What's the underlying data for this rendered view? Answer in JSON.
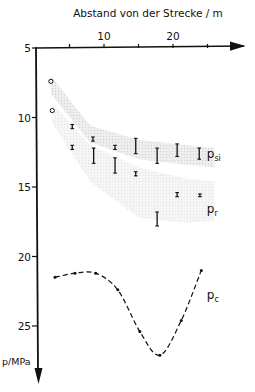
{
  "chart_data": {
    "type": "scatter",
    "title": "",
    "xlabel": "Abstand von der Strecke / m",
    "ylabel": "p/MPa",
    "xlim": [
      0,
      28
    ],
    "ylim": [
      5,
      28
    ],
    "y_inverted": true,
    "x_axis_position": "top",
    "x_ticks": [
      5,
      10,
      15,
      20,
      25
    ],
    "x_tick_labels": [
      "",
      "10",
      "",
      "20",
      ""
    ],
    "y_ticks": [
      5,
      10,
      15,
      20,
      25
    ],
    "y_tick_labels": [
      "5",
      "10",
      "15",
      "20",
      "25"
    ],
    "grid": false,
    "series": [
      {
        "name": "p_si",
        "label_main": "p",
        "label_sub": "si",
        "marker": "errorbar",
        "points": [
          {
            "x": 2.3,
            "y": 7.4,
            "marker": "circle"
          },
          {
            "x": 5.4,
            "y": 10.6,
            "ylow": 10.5,
            "yhigh": 10.8
          },
          {
            "x": 8.4,
            "y": 11.5,
            "ylow": 11.4,
            "yhigh": 11.7
          },
          {
            "x": 11.6,
            "y": 12.1,
            "ylow": 12.0,
            "yhigh": 12.3
          },
          {
            "x": 14.6,
            "y": 12.1,
            "ylow": 11.5,
            "yhigh": 12.6
          },
          {
            "x": 17.7,
            "y": 12.8,
            "ylow": 12.2,
            "yhigh": 13.3
          },
          {
            "x": 20.6,
            "y": 12.4,
            "ylow": 11.9,
            "yhigh": 12.8
          },
          {
            "x": 23.8,
            "y": 12.6,
            "ylow": 12.2,
            "yhigh": 13.0
          }
        ],
        "band": {
          "upper": [
            [
              2.3,
              7.0
            ],
            [
              8,
              10.6
            ],
            [
              15,
              11.6
            ],
            [
              22,
              12.0
            ],
            [
              26,
              12.2
            ]
          ],
          "lower": [
            [
              2.3,
              8.3
            ],
            [
              8,
              11.8
            ],
            [
              15,
              13.0
            ],
            [
              22,
              13.4
            ],
            [
              26,
              13.6
            ]
          ]
        }
      },
      {
        "name": "p_r",
        "label_main": "p",
        "label_sub": "r",
        "marker": "errorbar",
        "points": [
          {
            "x": 2.5,
            "y": 9.5,
            "marker": "circle"
          },
          {
            "x": 5.4,
            "y": 12.1,
            "ylow": 12.0,
            "yhigh": 12.3
          },
          {
            "x": 8.5,
            "y": 12.8,
            "ylow": 12.2,
            "yhigh": 13.3
          },
          {
            "x": 11.6,
            "y": 13.4,
            "ylow": 12.9,
            "yhigh": 14.0
          },
          {
            "x": 14.6,
            "y": 14.0,
            "ylow": 13.9,
            "yhigh": 14.2
          },
          {
            "x": 17.7,
            "y": 17.3,
            "ylow": 16.8,
            "yhigh": 17.8
          },
          {
            "x": 20.6,
            "y": 15.5,
            "ylow": 15.4,
            "yhigh": 15.7
          },
          {
            "x": 23.9,
            "y": 15.6,
            "ylow": 15.5,
            "yhigh": 15.7
          }
        ],
        "band": {
          "upper": [
            [
              2.5,
              9.0
            ],
            [
              8,
              12.0
            ],
            [
              15,
              13.6
            ],
            [
              22,
              14.4
            ],
            [
              26,
              14.6
            ]
          ],
          "lower": [
            [
              2.5,
              10.4
            ],
            [
              8,
              14.6
            ],
            [
              15,
              17.2
            ],
            [
              22,
              17.6
            ],
            [
              26,
              17.4
            ]
          ]
        }
      },
      {
        "name": "p_c",
        "label_main": "p",
        "label_sub": "c",
        "marker": "dot",
        "line": "dashed",
        "points": [
          {
            "x": 2.9,
            "y": 21.5
          },
          {
            "x": 5.8,
            "y": 21.2
          },
          {
            "x": 8.8,
            "y": 21.2
          },
          {
            "x": 12.0,
            "y": 22.4
          },
          {
            "x": 15.2,
            "y": 25.4
          },
          {
            "x": 18.1,
            "y": 27.1
          },
          {
            "x": 21.2,
            "y": 24.6
          },
          {
            "x": 24.1,
            "y": 21.0
          }
        ]
      }
    ],
    "series_labels_positions": {
      "p_si": {
        "x": 27.5,
        "y": 12.6
      },
      "p_r": {
        "x": 27.5,
        "y": 16.6
      },
      "p_c": {
        "x": 27.5,
        "y": 22.8
      }
    }
  },
  "colors": {
    "ink": "#111111",
    "band": "#e4e4e4"
  }
}
